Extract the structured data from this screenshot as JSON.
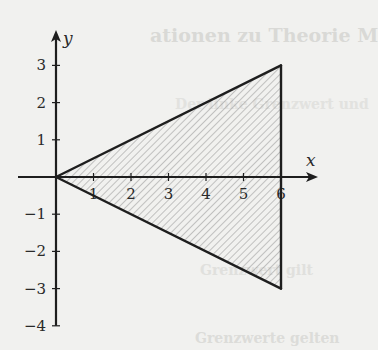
{
  "background_ghost_text": {
    "line1": "ationen zu Theorie M",
    "line2": "Der linke Grenzwert und",
    "line3": "Grenzwert gilt",
    "line4": "Grenzwerte gelten"
  },
  "chart_data": {
    "type": "area",
    "title": "",
    "xlabel": "x",
    "ylabel": "y",
    "xlim": [
      0,
      6.9
    ],
    "ylim": [
      -4,
      3.7
    ],
    "x_ticks": [
      1,
      2,
      3,
      4,
      5,
      6
    ],
    "x_tick_labels": [
      "1",
      "2",
      "3",
      "4",
      "5",
      "6"
    ],
    "y_ticks": [
      -4,
      -3,
      -2,
      -1,
      1,
      2,
      3
    ],
    "y_tick_labels": [
      "−4",
      "−3",
      "−2",
      "−1",
      "1",
      "2",
      "3"
    ],
    "grid": false,
    "legend": null,
    "shapes": [
      {
        "name": "shaded-triangle",
        "fill": "hatched",
        "vertices": [
          [
            0,
            0
          ],
          [
            6,
            3
          ],
          [
            6,
            -3
          ]
        ],
        "description": "Region bounded by y = x/2, y = -x/2 and x = 6"
      }
    ],
    "boundary_lines": [
      {
        "name": "upper-edge",
        "equation": "y = x/2",
        "from": [
          0,
          0
        ],
        "to": [
          6,
          3
        ]
      },
      {
        "name": "lower-edge",
        "equation": "y = -x/2",
        "from": [
          0,
          0
        ],
        "to": [
          6,
          -3
        ]
      },
      {
        "name": "right-edge",
        "equation": "x = 6",
        "from": [
          6,
          -3
        ],
        "to": [
          6,
          3
        ]
      }
    ]
  },
  "colors": {
    "ink": "#1e1e1e",
    "hatch": "#8a8a8a",
    "paper": "#f1f1ef"
  }
}
